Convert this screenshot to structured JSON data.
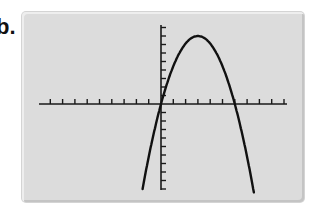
{
  "figure": {
    "label": "b.",
    "screen_color": "#dcdcdc",
    "axis_color": "#1a1a1a",
    "curve_color": "#111111"
  },
  "chart_data": {
    "type": "line",
    "title": "",
    "xlabel": "",
    "ylabel": "",
    "equation_estimate": "y = -(8/9) * x * (x - 6)",
    "x": [
      -1.5,
      -1,
      0,
      1,
      2,
      3,
      4,
      5,
      6,
      7,
      7.5
    ],
    "series": [
      {
        "name": "parabola",
        "values": [
          -10,
          -6.2,
          0,
          4.4,
          7.1,
          8,
          7.1,
          4.4,
          0,
          -6.2,
          -10
        ]
      }
    ],
    "xlim": [
      -10,
      10
    ],
    "ylim": [
      -10,
      10
    ],
    "x_tick_step": 1,
    "y_tick_step": 1,
    "grid": false,
    "legend": null
  }
}
